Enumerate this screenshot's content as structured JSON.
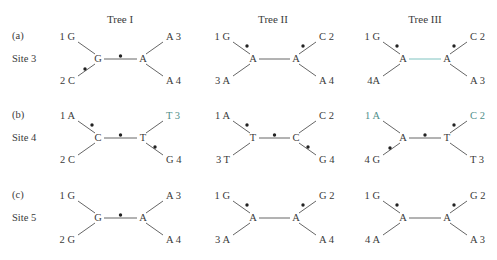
{
  "figure": {
    "columns": [
      {
        "label": "Tree I",
        "x": 120
      },
      {
        "label": "Tree II",
        "x": 273
      },
      {
        "label": "Tree III",
        "x": 425
      }
    ],
    "rows": [
      {
        "letter": "(a)",
        "site": "Site 3",
        "y": 59
      },
      {
        "letter": "(b)",
        "site": "Site 4",
        "y": 138
      },
      {
        "letter": "(c)",
        "site": "Site 5",
        "y": 218
      }
    ],
    "trees": [
      [
        {
          "left_node": "G",
          "right_node": "A",
          "tl": "1 G",
          "bl": "2 C",
          "tr": "A 3",
          "br": "A 4",
          "marks": [
            "bl",
            "mid"
          ],
          "tinted": []
        },
        {
          "left_node": "A",
          "right_node": "A",
          "tl": "1 G",
          "bl": "3 A",
          "tr": "C 2",
          "br": "A 4",
          "marks": [
            "tl",
            "tr"
          ],
          "tinted": []
        },
        {
          "left_node": "A",
          "right_node": "A",
          "tl": "1 G",
          "bl": "4A",
          "tr": "C 2",
          "br": "A 3",
          "marks": [
            "tl",
            "tr"
          ],
          "tinted": [
            "mid"
          ]
        }
      ],
      [
        {
          "left_node": "C",
          "right_node": "T",
          "tl": "1 A",
          "bl": "2 C",
          "tr": "T 3",
          "br": "G 4",
          "marks": [
            "tl",
            "mid",
            "br"
          ],
          "tinted": [
            "tr"
          ]
        },
        {
          "left_node": "T",
          "right_node": "C",
          "tl": "1 A",
          "bl": "3 T",
          "tr": "C 2",
          "br": "G 4",
          "marks": [
            "tl",
            "mid",
            "br"
          ],
          "tinted": []
        },
        {
          "left_node": "A",
          "right_node": "T",
          "tl": "1 A",
          "bl": "4 G",
          "tr": "C 2",
          "br": "T 3",
          "marks": [
            "bl",
            "mid",
            "tr"
          ],
          "tinted": [
            "tr",
            "tl"
          ]
        }
      ],
      [
        {
          "left_node": "G",
          "right_node": "A",
          "tl": "1 G",
          "bl": "2 G",
          "tr": "A 3",
          "br": "A 4",
          "marks": [
            "mid"
          ],
          "tinted": []
        },
        {
          "left_node": "A",
          "right_node": "A",
          "tl": "1 G",
          "bl": "3 A",
          "tr": "G 2",
          "br": "A 4",
          "marks": [
            "tl",
            "tr"
          ],
          "tinted": []
        },
        {
          "left_node": "A",
          "right_node": "A",
          "tl": "1 G",
          "bl": "4 A",
          "tr": "G 2",
          "br": "A 3",
          "marks": [
            "tl",
            "tr"
          ],
          "tinted": []
        }
      ]
    ],
    "colors": {
      "ink": "#3a3a3a",
      "tint": "#4f8f8a",
      "tint_line": "#7fc3c0"
    }
  }
}
